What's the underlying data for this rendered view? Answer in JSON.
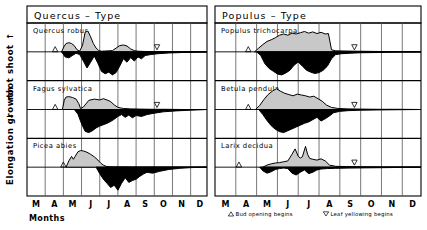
{
  "figure": {
    "y_axis": {
      "main_label": "Elongation growth",
      "sub_label": "root shoot",
      "shoot_arrow": "↑",
      "root_arrow": "↓"
    },
    "x_axis": {
      "label": "Months",
      "ticks": [
        "M",
        "A",
        "M",
        "J",
        "J",
        "A",
        "S",
        "O",
        "N",
        "D"
      ]
    },
    "legend": [
      {
        "symbol": "△",
        "text": "Bud opening begins"
      },
      {
        "symbol": "▽",
        "text": "Leaf yellowing begins"
      }
    ],
    "colors": {
      "shoot_fill": "#c8c8c8",
      "root_fill": "#000000",
      "line": "#000000",
      "grid": "#555555",
      "background": "#ffffff"
    }
  },
  "chart_data": {
    "type": "area",
    "xlabel": "Months",
    "ylabel": "Elongation growth",
    "x": [
      "M",
      "A",
      "M",
      "J",
      "J",
      "A",
      "S",
      "O",
      "N",
      "D"
    ],
    "xlim": [
      3,
      12.9
    ],
    "grid": true,
    "legend_position": "bottom",
    "panels": [
      {
        "title": "Quercus – Type",
        "series": [
          {
            "name": "Quercus robur",
            "bud_opening": 4.55,
            "leaf_yellowing": 10.15,
            "shoot": {
              "x": [
                4.9,
                5.05,
                5.15,
                5.3,
                5.45,
                5.6,
                5.75,
                5.9,
                6.05,
                6.2,
                6.35,
                6.5,
                6.65,
                6.8,
                6.95,
                7.1,
                7.3,
                7.5,
                7.7,
                7.9,
                8.1,
                8.3,
                8.5,
                8.7,
                8.9,
                9.1,
                9.4,
                9.8,
                10.3,
                11.0,
                12.0,
                12.9
              ],
              "y": [
                0.0,
                0.28,
                0.4,
                0.44,
                0.4,
                0.3,
                0.1,
                0.04,
                0.3,
                0.95,
                1.0,
                0.72,
                0.4,
                0.18,
                0.06,
                0.03,
                0.04,
                0.05,
                0.06,
                0.18,
                0.3,
                0.33,
                0.28,
                0.14,
                0.06,
                0.03,
                0.02,
                0.01,
                0.01,
                0.0,
                0.0,
                0.0
              ]
            },
            "root": {
              "x": [
                4.9,
                5.1,
                5.3,
                5.5,
                5.7,
                5.9,
                6.1,
                6.3,
                6.5,
                6.7,
                6.9,
                7.1,
                7.3,
                7.5,
                7.7,
                7.9,
                8.1,
                8.3,
                8.5,
                8.7,
                8.9,
                9.1,
                9.3,
                9.5,
                9.8,
                10.2,
                10.8,
                11.5,
                12.2,
                12.9
              ],
              "y": [
                0.0,
                0.22,
                0.26,
                0.16,
                0.06,
                0.12,
                0.4,
                0.7,
                0.45,
                0.18,
                0.5,
                0.85,
                0.95,
                0.88,
                1.0,
                0.9,
                0.62,
                0.3,
                0.45,
                0.25,
                0.4,
                0.22,
                0.3,
                0.16,
                0.12,
                0.08,
                0.05,
                0.03,
                0.02,
                0.0
              ]
            }
          },
          {
            "name": "Fagus sylvatica",
            "bud_opening": 4.55,
            "leaf_yellowing": 10.15,
            "shoot": {
              "x": [
                4.95,
                5.05,
                5.15,
                5.3,
                5.5,
                5.7,
                5.85,
                5.95,
                6.1,
                6.4,
                6.7,
                7.0,
                7.2,
                7.4,
                7.6,
                7.8,
                8.0,
                8.3,
                8.7,
                9.2,
                9.8,
                10.6,
                11.5,
                12.9
              ],
              "y": [
                0.0,
                0.45,
                0.6,
                0.62,
                0.58,
                0.5,
                0.28,
                0.04,
                0.12,
                0.44,
                0.5,
                0.46,
                0.52,
                0.46,
                0.38,
                0.22,
                0.1,
                0.05,
                0.03,
                0.02,
                0.01,
                0.01,
                0.0,
                0.0
              ]
            },
            "root": {
              "x": [
                5.6,
                5.8,
                6.0,
                6.2,
                6.4,
                6.6,
                6.8,
                7.0,
                7.2,
                7.4,
                7.6,
                7.8,
                8.0,
                8.2,
                8.4,
                8.6,
                8.8,
                9.0,
                9.3,
                9.6,
                10.0,
                10.5,
                11.2,
                12.0,
                12.9
              ],
              "y": [
                0.0,
                0.2,
                0.62,
                0.95,
                1.0,
                0.92,
                0.8,
                0.72,
                0.66,
                0.6,
                0.52,
                0.42,
                0.3,
                0.22,
                0.34,
                0.24,
                0.36,
                0.26,
                0.3,
                0.22,
                0.16,
                0.1,
                0.06,
                0.03,
                0.0
              ]
            }
          },
          {
            "name": "Picea abies",
            "bud_opening": 5.0,
            "leaf_yellowing": null,
            "shoot": {
              "x": [
                5.15,
                5.3,
                5.45,
                5.55,
                5.65,
                5.8,
                5.95,
                6.1,
                6.3,
                6.5,
                6.7,
                6.9,
                7.05,
                7.2,
                7.35,
                7.5,
                7.8,
                8.2,
                8.8,
                9.6,
                10.6,
                12.9
              ],
              "y": [
                0.0,
                0.3,
                0.52,
                0.38,
                0.52,
                0.74,
                0.8,
                0.78,
                0.72,
                0.62,
                0.5,
                0.34,
                0.2,
                0.1,
                0.04,
                0.02,
                0.01,
                0.01,
                0.0,
                0.0,
                0.0,
                0.0
              ]
            },
            "root": {
              "x": [
                6.8,
                7.0,
                7.2,
                7.4,
                7.6,
                7.8,
                8.0,
                8.2,
                8.4,
                8.6,
                8.8,
                9.0,
                9.2,
                9.4,
                9.6,
                9.9,
                10.3,
                10.8,
                11.4,
                12.0,
                12.9
              ],
              "y": [
                0.0,
                0.28,
                0.52,
                0.7,
                0.88,
                0.78,
                1.0,
                0.7,
                0.46,
                0.66,
                0.58,
                0.52,
                0.4,
                0.3,
                0.22,
                0.26,
                0.18,
                0.1,
                0.05,
                0.02,
                0.0
              ]
            }
          }
        ]
      },
      {
        "title": "Populus – Type",
        "series": [
          {
            "name": "Populus trichocarpa",
            "bud_opening": 4.6,
            "leaf_yellowing": 9.7,
            "shoot": {
              "x": [
                4.9,
                5.1,
                5.3,
                5.5,
                5.7,
                5.9,
                6.1,
                6.3,
                6.5,
                6.7,
                6.9,
                7.1,
                7.3,
                7.5,
                7.7,
                7.9,
                8.1,
                8.3,
                8.45,
                8.6,
                8.8,
                9.2,
                9.8,
                10.6,
                11.6,
                12.9
              ],
              "y": [
                0.0,
                0.18,
                0.35,
                0.5,
                0.58,
                0.68,
                0.8,
                0.86,
                0.8,
                0.9,
                0.86,
                0.92,
                0.98,
                0.9,
                0.96,
                0.88,
                0.94,
                0.86,
                0.88,
                0.1,
                0.05,
                0.04,
                0.03,
                0.02,
                0.01,
                0.0
              ]
            },
            "root": {
              "x": [
                5.0,
                5.2,
                5.4,
                5.6,
                5.8,
                6.0,
                6.2,
                6.4,
                6.6,
                6.8,
                7.0,
                7.2,
                7.4,
                7.6,
                7.8,
                8.0,
                8.2,
                8.4,
                8.6,
                8.8,
                9.1,
                9.5,
                10.0,
                10.8,
                11.8,
                12.9
              ],
              "y": [
                0.0,
                0.16,
                0.52,
                0.72,
                0.84,
                0.96,
                1.0,
                0.92,
                0.8,
                0.58,
                0.44,
                0.62,
                0.8,
                0.88,
                0.94,
                0.9,
                0.8,
                0.62,
                0.3,
                0.12,
                0.08,
                0.06,
                0.04,
                0.03,
                0.01,
                0.0
              ]
            }
          },
          {
            "name": "Betula pendula",
            "bud_opening": 4.6,
            "leaf_yellowing": 9.7,
            "shoot": {
              "x": [
                4.95,
                5.15,
                5.35,
                5.55,
                5.75,
                5.95,
                6.15,
                6.35,
                6.55,
                6.75,
                6.95,
                7.15,
                7.35,
                7.55,
                7.75,
                7.95,
                8.15,
                8.35,
                8.6,
                8.9,
                9.4,
                10.0,
                10.8,
                11.8,
                12.9
              ],
              "y": [
                0.0,
                0.2,
                0.48,
                0.72,
                0.88,
                1.0,
                0.88,
                0.78,
                0.72,
                0.66,
                0.74,
                0.7,
                0.66,
                0.6,
                0.64,
                0.52,
                0.4,
                0.22,
                0.1,
                0.05,
                0.03,
                0.02,
                0.01,
                0.01,
                0.0
              ]
            },
            "root": {
              "x": [
                5.1,
                5.3,
                5.5,
                5.7,
                5.9,
                6.1,
                6.3,
                6.5,
                6.7,
                6.9,
                7.1,
                7.3,
                7.5,
                7.7,
                7.9,
                8.1,
                8.3,
                8.5,
                8.7,
                9.0,
                9.4,
                10.0,
                10.8,
                11.8,
                12.9
              ],
              "y": [
                0.0,
                0.22,
                0.48,
                0.7,
                0.86,
                0.96,
                1.0,
                0.92,
                0.84,
                0.76,
                0.68,
                0.6,
                0.54,
                0.44,
                0.34,
                0.5,
                0.4,
                0.28,
                0.14,
                0.08,
                0.05,
                0.03,
                0.02,
                0.01,
                0.0
              ]
            }
          },
          {
            "name": "Larix decidua",
            "bud_opening": 4.15,
            "leaf_yellowing": 9.7,
            "shoot": {
              "x": [
                5.3,
                5.5,
                5.7,
                5.9,
                6.1,
                6.3,
                6.5,
                6.7,
                6.85,
                7.0,
                7.1,
                7.2,
                7.35,
                7.45,
                7.55,
                7.7,
                7.9,
                8.1,
                8.3,
                8.5,
                8.8,
                9.3,
                10.0,
                11.0,
                12.9
              ],
              "y": [
                0.0,
                0.1,
                0.16,
                0.2,
                0.22,
                0.26,
                0.3,
                0.62,
                0.88,
                0.52,
                0.44,
                0.5,
                1.0,
                0.62,
                0.42,
                0.38,
                0.34,
                0.4,
                0.3,
                0.1,
                0.04,
                0.03,
                0.02,
                0.01,
                0.0
              ]
            },
            "root": {
              "x": [
                5.15,
                5.3,
                5.5,
                5.7,
                5.9,
                6.1,
                6.3,
                6.5,
                6.7,
                6.9,
                7.1,
                7.3,
                7.5,
                7.7,
                7.9,
                8.1,
                8.4,
                8.8,
                9.4,
                10.2,
                11.2,
                12.9
              ],
              "y": [
                0.0,
                0.16,
                0.26,
                0.2,
                0.1,
                0.06,
                0.04,
                0.06,
                0.26,
                0.34,
                0.22,
                0.12,
                0.28,
                0.22,
                0.12,
                0.08,
                0.06,
                0.05,
                0.04,
                0.03,
                0.02,
                0.0
              ]
            }
          }
        ]
      }
    ]
  }
}
